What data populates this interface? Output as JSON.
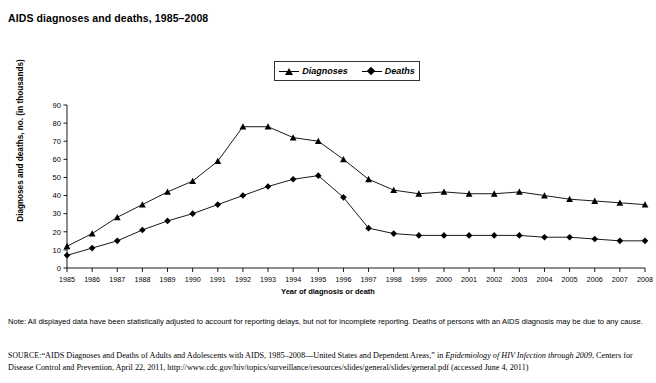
{
  "figure": {
    "title": "AIDS diagnoses and deaths, 1985–2008",
    "note": "Note: All displayed data have been statistically adjusted to account for reporting delays, but not for incomplete reporting. Deaths of persons with an AIDS diagnosis may be due to any cause.",
    "source_label": "SOURCE:",
    "source_text_1": "“AIDS Diagnoses and Deaths of Adults and Adolescents with AIDS, 1985–2008—United States and Dependent Areas,” in ",
    "source_italic_1": "Epidemiology of HIV Infection through 2009",
    "source_text_2": ", Centers for Disease Control and Prevention, April 22, 2011, http://www.cdc.gov/hiv/topics/surveillance/resources/slides/general/slides/general.pdf (accessed June 4, 2011)"
  },
  "chart_data": {
    "type": "line",
    "title": "AIDS diagnoses and deaths, 1985–2008",
    "xlabel": "Year of diagnosis or death",
    "ylabel": "Diagnoses and deaths, no. (in thousands)",
    "categories": [
      1985,
      1986,
      1987,
      1988,
      1989,
      1990,
      1991,
      1992,
      1993,
      1994,
      1995,
      1996,
      1997,
      1998,
      1999,
      2000,
      2001,
      2002,
      2003,
      2004,
      2005,
      2006,
      2007,
      2008
    ],
    "xtick_labels": [
      "1985",
      "1986",
      "1987",
      "1988",
      "1989",
      "1990",
      "1991",
      "1992",
      "1993",
      "1994",
      "1995",
      "1996",
      "1997",
      "1998",
      "1999",
      "2000",
      "2001",
      "2002",
      "2003",
      "2004",
      "2005",
      "2006",
      "2007",
      "2008"
    ],
    "ytick_labels": [
      "0",
      "10",
      "20",
      "30",
      "40",
      "50",
      "60",
      "70",
      "80",
      "90"
    ],
    "ylim": [
      0,
      90
    ],
    "ytick_step": 10,
    "grid": false,
    "legend_position": "top-center",
    "series": [
      {
        "name": "Diagnoses",
        "marker": "triangle",
        "color": "#000000",
        "values": [
          12,
          19,
          28,
          35,
          42,
          48,
          59,
          78,
          78,
          72,
          70,
          60,
          49,
          43,
          41,
          42,
          41,
          41,
          42,
          40,
          38,
          37,
          36,
          35
        ]
      },
      {
        "name": "Deaths",
        "marker": "diamond",
        "color": "#000000",
        "values": [
          7,
          11,
          15,
          21,
          26,
          30,
          35,
          40,
          45,
          49,
          51,
          39,
          22,
          19,
          18,
          18,
          18,
          18,
          18,
          17,
          17,
          16,
          15,
          15
        ]
      }
    ]
  }
}
